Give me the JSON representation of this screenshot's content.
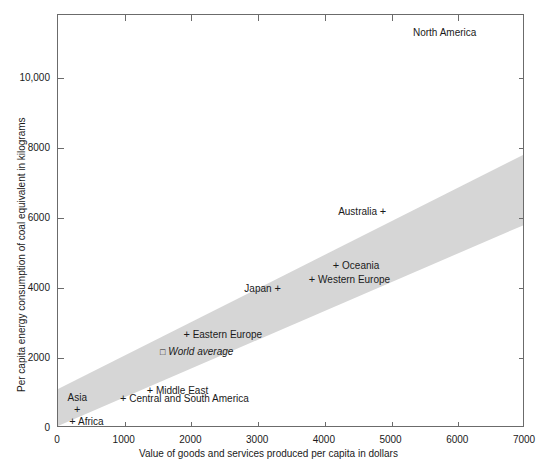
{
  "chart_data": {
    "type": "scatter",
    "title": "",
    "xlabel": "Value of goods and services produced per capita in dollars",
    "ylabel": "Per capita energy consumption of coal equivalent in kilograms",
    "xlim": [
      0,
      7000
    ],
    "ylim": [
      0,
      11800
    ],
    "xticks": [
      "0",
      "1000",
      "2000",
      "3000",
      "4000",
      "5000",
      "6000",
      "7000"
    ],
    "xtick_values": [
      0,
      1000,
      2000,
      3000,
      4000,
      5000,
      6000,
      7000
    ],
    "yticks": [
      "0",
      "2000",
      "4000",
      "6000",
      "8000",
      "10,000"
    ],
    "ytick_values": [
      0,
      2000,
      4000,
      6000,
      8000,
      10000
    ],
    "grid": false,
    "legend": "none",
    "band": {
      "description": "shaded diagonal correlation band",
      "color": "#d6d6d6",
      "left_x": 0,
      "left_y_low": 0,
      "left_y_high": 1060,
      "right_x": 7000,
      "right_y_low": 5760,
      "right_y_high": 7780
    },
    "points": [
      {
        "name": "Africa",
        "x": 170,
        "y": 190,
        "label": "Africa",
        "marker": "+",
        "label_pos": "right-of-marker",
        "italic": false
      },
      {
        "name": "Asia",
        "x": 290,
        "y": 560,
        "label": "Asia",
        "marker": "+",
        "label_pos": "above",
        "italic": false
      },
      {
        "name": "Central and South America",
        "x": 930,
        "y": 860,
        "label": "Central and South America",
        "marker": "+",
        "label_pos": "right-of-marker",
        "italic": false
      },
      {
        "name": "Middle East",
        "x": 1330,
        "y": 1100,
        "label": "Middle East",
        "marker": "+",
        "label_pos": "right-of-marker",
        "italic": false
      },
      {
        "name": "World average",
        "x": 1530,
        "y": 2180,
        "label": "World average",
        "marker": "sq",
        "label_pos": "right-of-marker",
        "italic": true
      },
      {
        "name": "Eastern Europe",
        "x": 1880,
        "y": 2700,
        "label": "Eastern Europe",
        "marker": "+",
        "label_pos": "right-of-marker",
        "italic": false
      },
      {
        "name": "Japan",
        "x": 3370,
        "y": 4000,
        "label": "Japan",
        "marker": "+",
        "label_pos": "left-of-marker",
        "italic": false
      },
      {
        "name": "Western Europe",
        "x": 3760,
        "y": 4260,
        "label": "Western Europe",
        "marker": "+",
        "label_pos": "right-of-marker",
        "italic": false
      },
      {
        "name": "Oceania",
        "x": 4120,
        "y": 4660,
        "label": "Oceania",
        "marker": "+",
        "label_pos": "right-of-marker",
        "italic": false
      },
      {
        "name": "Australia",
        "x": 4950,
        "y": 6200,
        "label": "Australia",
        "marker": "+",
        "label_pos": "left-of-marker",
        "italic": false
      },
      {
        "name": "North America",
        "x": 6300,
        "y": 11300,
        "label": "North America",
        "marker": "none",
        "label_pos": "only-label",
        "italic": false
      }
    ],
    "colors": {
      "band": "#d6d6d6",
      "axis": "#6b6b6b",
      "text": "#1a1a1a",
      "background": "#ffffff"
    }
  }
}
